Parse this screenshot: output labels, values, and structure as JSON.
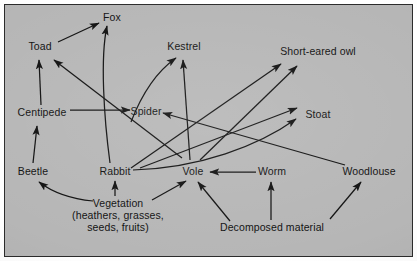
{
  "diagram": {
    "type": "food-web",
    "background_color": "#b6b6b6",
    "border_color": "#2b2b2b",
    "line_color": "#101010",
    "text_color": "#101010",
    "nodes": [
      {
        "id": "fox",
        "label": "Fox",
        "x": 112,
        "y": 18,
        "align": "center"
      },
      {
        "id": "toad",
        "label": "Toad",
        "x": 40,
        "y": 47,
        "align": "center"
      },
      {
        "id": "kestrel",
        "label": "Kestrel",
        "x": 184,
        "y": 47,
        "align": "center"
      },
      {
        "id": "owl",
        "label": "Short-eared owl",
        "x": 318,
        "y": 52,
        "align": "center"
      },
      {
        "id": "centipede",
        "label": "Centipede",
        "x": 42,
        "y": 113,
        "align": "center"
      },
      {
        "id": "spider",
        "label": "Spider",
        "x": 146,
        "y": 112,
        "align": "center"
      },
      {
        "id": "stoat",
        "label": "Stoat",
        "x": 318,
        "y": 115,
        "align": "center"
      },
      {
        "id": "beetle",
        "label": "Beetle",
        "x": 33,
        "y": 172,
        "align": "center"
      },
      {
        "id": "rabbit",
        "label": "Rabbit",
        "x": 115,
        "y": 172,
        "align": "center"
      },
      {
        "id": "vole",
        "label": "Vole",
        "x": 193,
        "y": 172,
        "align": "center"
      },
      {
        "id": "worm",
        "label": "Worm",
        "x": 272,
        "y": 172,
        "align": "center"
      },
      {
        "id": "woodlouse",
        "label": "Woodlouse",
        "x": 369,
        "y": 172,
        "align": "center"
      },
      {
        "id": "vegetation",
        "label": "Vegetation",
        "label_line2": "(heathers, grasses,",
        "label_line3": "seeds, fruits)",
        "x": 118,
        "y": 205,
        "align": "center"
      },
      {
        "id": "decomposed",
        "label": "Decomposed material",
        "x": 272,
        "y": 228,
        "align": "center"
      }
    ],
    "links": [
      {
        "from": "toad",
        "to": "fox",
        "style": "straight"
      },
      {
        "from": "rabbit",
        "to": "fox",
        "style": "curved"
      },
      {
        "from": "centipede",
        "to": "toad",
        "style": "straight"
      },
      {
        "from": "vole",
        "to": "toad",
        "style": "straight"
      },
      {
        "from": "beetle",
        "to": "centipede",
        "style": "straight"
      },
      {
        "from": "centipede",
        "to": "spider",
        "style": "straight"
      },
      {
        "from": "woodlouse",
        "to": "spider",
        "style": "straight"
      },
      {
        "from": "spider",
        "to": "kestrel",
        "style": "curved"
      },
      {
        "from": "vole",
        "to": "kestrel",
        "style": "straight"
      },
      {
        "from": "rabbit",
        "to": "owl",
        "style": "straight"
      },
      {
        "from": "vole",
        "to": "owl",
        "style": "straight"
      },
      {
        "from": "rabbit",
        "to": "stoat",
        "style": "curved"
      },
      {
        "from": "vole",
        "to": "stoat",
        "style": "straight"
      },
      {
        "from": "worm",
        "to": "vole",
        "style": "straight"
      },
      {
        "from": "vegetation",
        "to": "beetle",
        "style": "curved"
      },
      {
        "from": "vegetation",
        "to": "rabbit",
        "style": "straight"
      },
      {
        "from": "vegetation",
        "to": "vole",
        "style": "straight"
      },
      {
        "from": "decomposed",
        "to": "vole",
        "style": "straight"
      },
      {
        "from": "decomposed",
        "to": "worm",
        "style": "straight"
      },
      {
        "from": "decomposed",
        "to": "woodlouse",
        "style": "straight"
      }
    ]
  }
}
